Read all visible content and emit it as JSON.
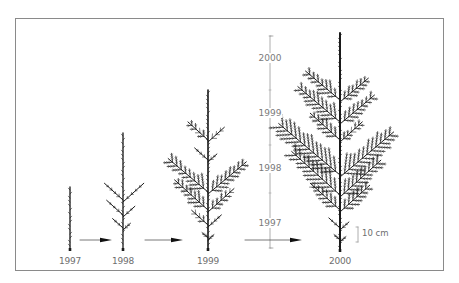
{
  "figure": {
    "colors": {
      "tree": "#1a1a1a",
      "frame": "#8a8a8a",
      "scale": "#9a9a9a",
      "text": "#6e6e6e",
      "arrow": "#111111"
    }
  },
  "trees": [
    {
      "year": "1997",
      "label_x": 70,
      "x": 70,
      "base_y": 250,
      "top_y": 187,
      "tiers": []
    },
    {
      "year": "1998",
      "label_x": 123,
      "x": 123,
      "base_y": 250,
      "top_y": 133,
      "tiers": [
        {
          "y": 200,
          "left": 25,
          "right": 28,
          "angle": 40
        },
        {
          "y": 215,
          "left": 22,
          "right": 16,
          "angle": 40
        },
        {
          "y": 228,
          "left": 14,
          "right": 10,
          "angle": 40
        }
      ]
    },
    {
      "year": "1999",
      "label_x": 208,
      "x": 208,
      "base_y": 250,
      "top_y": 90,
      "tiers": [
        {
          "y": 140,
          "left": 27,
          "right": 22,
          "angle": 40
        },
        {
          "y": 160,
          "left": 18,
          "right": 12,
          "angle": 40
        },
        {
          "y": 192,
          "left": 52,
          "right": 50,
          "angle": 42
        },
        {
          "y": 210,
          "left": 45,
          "right": 35,
          "angle": 40
        },
        {
          "y": 225,
          "left": 22,
          "right": 18,
          "angle": 40
        },
        {
          "y": 238,
          "left": 8,
          "right": 8,
          "angle": 40
        }
      ]
    },
    {
      "year": "2000",
      "label_x": 340,
      "x": 340,
      "base_y": 251,
      "top_y": 33,
      "tiers": [
        {
          "y": 100,
          "left": 45,
          "right": 37,
          "angle": 42
        },
        {
          "y": 122,
          "left": 55,
          "right": 45,
          "angle": 42
        },
        {
          "y": 140,
          "left": 40,
          "right": 30,
          "angle": 40
        },
        {
          "y": 175,
          "left": 80,
          "right": 70,
          "angle": 42
        },
        {
          "y": 195,
          "left": 65,
          "right": 55,
          "angle": 40
        },
        {
          "y": 210,
          "left": 40,
          "right": 40,
          "angle": 40
        },
        {
          "y": 228,
          "left": 15,
          "right": 12,
          "angle": 40
        },
        {
          "y": 240,
          "left": 8,
          "right": 8,
          "angle": 40
        }
      ]
    }
  ],
  "arrows": [
    {
      "x1": 80,
      "x2": 112,
      "y": 240
    },
    {
      "x1": 145,
      "x2": 183,
      "y": 240
    },
    {
      "x1": 245,
      "x2": 302,
      "y": 240
    }
  ],
  "height_scale": {
    "x": 270,
    "top_y": 36,
    "bottom_y": 248,
    "labels": [
      {
        "text": "2000",
        "y": 58
      },
      {
        "text": "1999",
        "y": 113
      },
      {
        "text": "1998",
        "y": 168
      },
      {
        "text": "1997",
        "y": 223
      }
    ],
    "ticks": [
      36,
      90,
      145,
      193,
      248
    ]
  },
  "scale_bar": {
    "label": "10 cm",
    "x": 358,
    "top_y": 227,
    "bottom_y": 242
  }
}
